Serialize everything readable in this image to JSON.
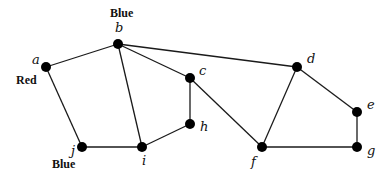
{
  "graph": {
    "nodes": [
      {
        "id": "a",
        "label": "a",
        "x": 46,
        "y": 67,
        "lx": 32,
        "ly": 64
      },
      {
        "id": "b",
        "label": "b",
        "x": 118,
        "y": 44,
        "lx": 115,
        "ly": 32
      },
      {
        "id": "c",
        "label": "c",
        "x": 190,
        "y": 78,
        "lx": 199,
        "ly": 75
      },
      {
        "id": "d",
        "label": "d",
        "x": 297,
        "y": 67,
        "lx": 307,
        "ly": 63
      },
      {
        "id": "e",
        "label": "e",
        "x": 357,
        "y": 112,
        "lx": 367,
        "ly": 109
      },
      {
        "id": "f",
        "label": "f",
        "x": 262,
        "y": 147,
        "lx": 251,
        "ly": 166
      },
      {
        "id": "g",
        "label": "g",
        "x": 357,
        "y": 147,
        "lx": 367,
        "ly": 155
      },
      {
        "id": "h",
        "label": "h",
        "x": 190,
        "y": 124,
        "lx": 200,
        "ly": 131
      },
      {
        "id": "i",
        "label": "i",
        "x": 142,
        "y": 147,
        "lx": 142,
        "ly": 165
      },
      {
        "id": "j",
        "label": "j",
        "x": 82,
        "y": 147,
        "lx": 71,
        "ly": 155
      }
    ],
    "edges": [
      [
        "a",
        "b"
      ],
      [
        "a",
        "j"
      ],
      [
        "b",
        "i"
      ],
      [
        "b",
        "c"
      ],
      [
        "b",
        "d"
      ],
      [
        "c",
        "h"
      ],
      [
        "c",
        "f"
      ],
      [
        "h",
        "i"
      ],
      [
        "i",
        "j"
      ],
      [
        "d",
        "f"
      ],
      [
        "d",
        "e"
      ],
      [
        "e",
        "g"
      ],
      [
        "f",
        "g"
      ]
    ],
    "color_labels": [
      {
        "node": "b",
        "text": "Blue",
        "x": 110,
        "y": 17
      },
      {
        "node": "a",
        "text": "Red",
        "x": 16,
        "y": 84
      },
      {
        "node": "j",
        "text": "Blue",
        "x": 52,
        "y": 168
      }
    ]
  }
}
